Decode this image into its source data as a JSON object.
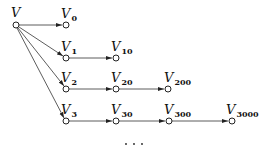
{
  "diagram": {
    "type": "tree",
    "root": {
      "id": "V",
      "label": "V",
      "sub": "",
      "x": 16,
      "y": 25
    },
    "nodes": [
      {
        "id": "V0",
        "label": "V",
        "sub": "0",
        "x": 66,
        "y": 25
      },
      {
        "id": "V1",
        "label": "V",
        "sub": "1",
        "x": 66,
        "y": 58
      },
      {
        "id": "V10",
        "label": "V",
        "sub": "10",
        "x": 116,
        "y": 58
      },
      {
        "id": "V2",
        "label": "V",
        "sub": "2",
        "x": 66,
        "y": 89
      },
      {
        "id": "V20",
        "label": "V",
        "sub": "20",
        "x": 116,
        "y": 89
      },
      {
        "id": "V200",
        "label": "V",
        "sub": "200",
        "x": 168,
        "y": 89
      },
      {
        "id": "V3",
        "label": "V",
        "sub": "3",
        "x": 66,
        "y": 121
      },
      {
        "id": "V30",
        "label": "V",
        "sub": "30",
        "x": 116,
        "y": 121
      },
      {
        "id": "V300",
        "label": "V",
        "sub": "300",
        "x": 169,
        "y": 121
      },
      {
        "id": "V3000",
        "label": "V",
        "sub": "3000",
        "x": 232,
        "y": 121
      }
    ],
    "edges": [
      [
        "V",
        "V0"
      ],
      [
        "V",
        "V1"
      ],
      [
        "V",
        "V2"
      ],
      [
        "V",
        "V3"
      ],
      [
        "V1",
        "V10"
      ],
      [
        "V2",
        "V20"
      ],
      [
        "V20",
        "V200"
      ],
      [
        "V3",
        "V30"
      ],
      [
        "V30",
        "V300"
      ],
      [
        "V300",
        "V3000"
      ]
    ],
    "ellipsis": "· · ·"
  },
  "labels": {
    "V": "V",
    "V0": {
      "main": "V",
      "sub": "0"
    },
    "V1": {
      "main": "V",
      "sub": "1"
    },
    "V10": {
      "main": "V",
      "sub": "10"
    },
    "V2": {
      "main": "V",
      "sub": "2"
    },
    "V20": {
      "main": "V",
      "sub": "20"
    },
    "V200": {
      "main": "V",
      "sub": "200"
    },
    "V3": {
      "main": "V",
      "sub": "3"
    },
    "V30": {
      "main": "V",
      "sub": "30"
    },
    "V300": {
      "main": "V",
      "sub": "300"
    },
    "V3000": {
      "main": "V",
      "sub": "3000"
    }
  }
}
